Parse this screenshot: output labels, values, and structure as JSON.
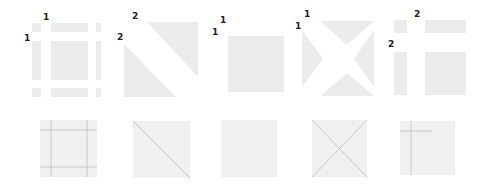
{
  "colors": {
    "fill": "#ececec",
    "box_fill": "#f0f0f0",
    "line": "#bdbdbd",
    "label": "#222222",
    "background": "#ffffff"
  },
  "top_row": [
    {
      "name": "nine-slice",
      "labels": [
        "1",
        "1"
      ]
    },
    {
      "name": "diagonal-split",
      "labels": [
        "2",
        "2"
      ]
    },
    {
      "name": "plain-square",
      "labels": [
        "1",
        "1"
      ]
    },
    {
      "name": "cross-split",
      "labels": [
        "1",
        "1"
      ]
    },
    {
      "name": "four-slice",
      "labels": [
        "2",
        "2"
      ]
    }
  ],
  "bottom_row": [
    {
      "name": "nine-slice-guides"
    },
    {
      "name": "diagonal-guide"
    },
    {
      "name": "plain-box"
    },
    {
      "name": "cross-guides"
    },
    {
      "name": "four-slice-guides"
    }
  ]
}
